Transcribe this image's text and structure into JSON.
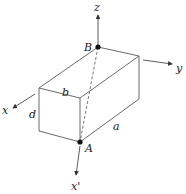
{
  "diagram": {
    "type": "rectangular box with coordinate axes",
    "labels": {
      "z": "z",
      "y": "y",
      "x": "x",
      "x_prime": "x'",
      "B": "B",
      "A": "A",
      "a": "a",
      "b": "b",
      "d": "d"
    },
    "points": [
      {
        "name": "B",
        "x": 98,
        "y": 47
      },
      {
        "name": "A",
        "x": 80,
        "y": 142
      }
    ],
    "colors": {
      "line": "#333333",
      "point": "#111111",
      "background": "#ffffff"
    }
  }
}
